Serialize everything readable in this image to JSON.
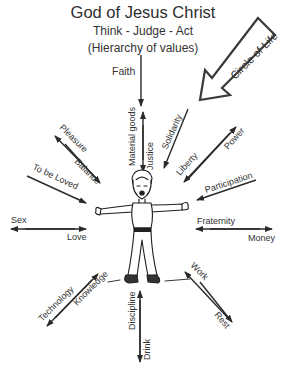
{
  "header": {
    "title": "God of Jesus Christ",
    "subtitle": "Think - Judge - Act",
    "caption": "(Hierarchy of values)"
  },
  "banner_arrow": {
    "label": "Circle of Life"
  },
  "value_pairs": [
    {
      "id": "faith",
      "labels": [
        "Faith"
      ]
    },
    {
      "id": "material-justice",
      "labels": [
        "Material goods",
        "Justice"
      ]
    },
    {
      "id": "solidarity",
      "labels": [
        "Solidarity"
      ]
    },
    {
      "id": "liberty-power",
      "labels": [
        "Liberty",
        "Power"
      ]
    },
    {
      "id": "participation",
      "labels": [
        "Participation"
      ]
    },
    {
      "id": "fraternity-money",
      "labels": [
        "Fraternity",
        "Money"
      ]
    },
    {
      "id": "work-rest",
      "labels": [
        "Work",
        "Rest"
      ]
    },
    {
      "id": "discipline-drink",
      "labels": [
        "Discipline",
        "Drink"
      ]
    },
    {
      "id": "technology-knowledge",
      "labels": [
        "Technology",
        "Knowledge"
      ]
    },
    {
      "id": "sex-love",
      "labels": [
        "Sex",
        "Love"
      ]
    },
    {
      "id": "to-be-loved",
      "labels": [
        "To be Loved"
      ]
    },
    {
      "id": "pleasure-balance",
      "labels": [
        "Pleasure",
        "Balance"
      ]
    }
  ],
  "labels": {
    "faith": "Faith",
    "material_goods": "Material goods",
    "justice": "Justice",
    "solidarity": "Solidarity",
    "liberty": "Liberty",
    "power": "Power",
    "participation": "Participation",
    "fraternity": "Fraternity",
    "money": "Money",
    "work": "Work",
    "rest": "Rest",
    "discipline": "Discipline",
    "drink": "Drink",
    "technology": "Technology",
    "knowledge": "Knowledge",
    "sex": "Sex",
    "love": "Love",
    "to_be_loved": "To be Loved",
    "pleasure": "Pleasure",
    "balance": "Balance",
    "circle_of_life": "Circle of Life"
  },
  "center_figure": {
    "description": "cartoon person with outstretched arms"
  }
}
